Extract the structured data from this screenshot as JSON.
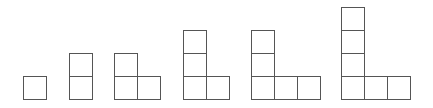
{
  "diagram": {
    "cell_size": 23,
    "baseline_y": 99,
    "stroke_color": "#555555",
    "background": "#ffffff",
    "figures": [
      {
        "index": 1,
        "tiles": 1,
        "left": 23,
        "column_height": 1,
        "row_length": 1
      },
      {
        "index": 2,
        "tiles": 2,
        "left": 69,
        "column_height": 2,
        "row_length": 1
      },
      {
        "index": 3,
        "tiles": 3,
        "left": 114,
        "column_height": 2,
        "row_length": 2
      },
      {
        "index": 4,
        "tiles": 4,
        "left": 183,
        "column_height": 3,
        "row_length": 2
      },
      {
        "index": 5,
        "tiles": 5,
        "left": 251,
        "column_height": 3,
        "row_length": 3
      },
      {
        "index": 6,
        "tiles": 6,
        "left": 341,
        "column_height": 4,
        "row_length": 3
      }
    ]
  }
}
